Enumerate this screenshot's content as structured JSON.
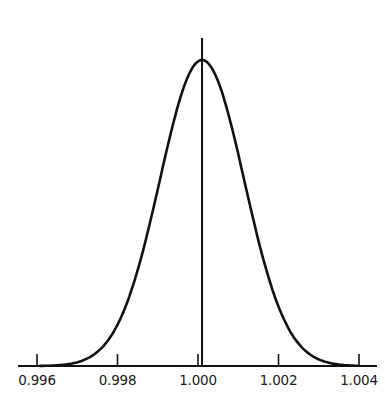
{
  "chart_data": {
    "type": "line",
    "title": "",
    "xlabel": "",
    "ylabel": "",
    "xlim": [
      0.9955,
      1.0045
    ],
    "ticks": [
      "0.996",
      "0.998",
      "1.000",
      "1.002",
      "1.004"
    ],
    "tick_values": [
      0.996,
      0.998,
      1.0,
      1.002,
      1.004
    ],
    "mean": 1.0001,
    "std_dev": 0.00105,
    "grid": false,
    "legend": null,
    "series": [
      {
        "name": "distribution",
        "x": [
          0.996,
          0.997,
          0.998,
          0.999,
          1.0,
          1.0001,
          1.001,
          1.002,
          1.003,
          1.004
        ],
        "values": [
          0.0,
          0.05,
          0.2,
          0.62,
          0.99,
          1.0,
          0.68,
          0.2,
          0.04,
          0.0
        ]
      }
    ],
    "vertical_line_at": 1.0001,
    "colors": {
      "line": "#111111",
      "background": "#ffffff"
    }
  }
}
